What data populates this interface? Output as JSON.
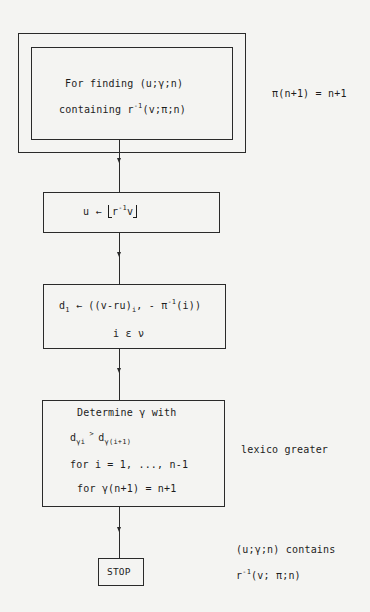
{
  "flowchart": {
    "start": {
      "line1": "For finding  (u;γ;n)",
      "line2_prefix": "containing  r",
      "line2_sup": "-1",
      "line2_suffix": "(v;π;n)",
      "annotation": "π(n+1)  =  n+1"
    },
    "step1": {
      "lhs": "u",
      "arrow": "←",
      "r": "r",
      "sup": "-1",
      "v": "v"
    },
    "step2": {
      "d": "d",
      "d_sub": "1",
      "arrow": "←",
      "expr_a": "((v-ru)",
      "expr_a_sub": "i",
      "expr_b": ",  - π",
      "expr_b_sup": "-1",
      "expr_c": "(i))",
      "line2": "i  ε  ν"
    },
    "step3": {
      "line1": "Determine  γ  with",
      "d1": "d",
      "d1_sub": "γi",
      "gt": " > ",
      "d2": "d",
      "d2_sub": "γ(i+1)",
      "line3": "for  i = 1, ..., n-1",
      "line4": "for  γ(n+1) = n+1",
      "annotation": "lexico greater"
    },
    "end": {
      "label": "STOP",
      "annotation_line1": "(u;γ;n)  contains",
      "annotation_r": "r",
      "annotation_sup": "-1",
      "annotation_rest": "(v; π;n)"
    }
  }
}
